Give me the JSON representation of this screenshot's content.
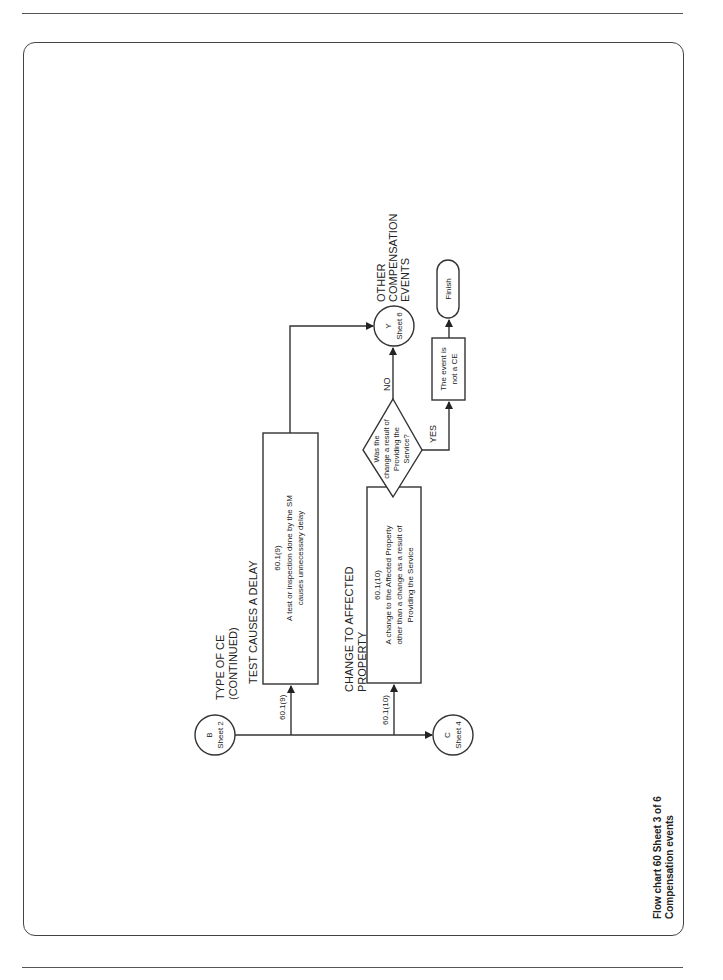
{
  "page": {
    "header_running_title": "FLOW CHARTS",
    "footer_caption": {
      "line1": "Flow chart 60 Sheet 3 of 6",
      "line2": "Compensation events"
    }
  },
  "flowchart": {
    "heading": {
      "line1": "TYPE OF CE",
      "line2": "(CONTINUED)"
    },
    "connectors": {
      "start": {
        "letter": "B",
        "sheet": "Sheet 2"
      },
      "continue": {
        "letter": "C",
        "sheet": "Sheet 4"
      },
      "other": {
        "letter": "Y",
        "sheet": "Sheet 6",
        "label_line1": "OTHER",
        "label_line2": "COMPENSATION",
        "label_line3": "EVENTS"
      }
    },
    "branches": [
      {
        "clause_label": "60.1(9)",
        "title": "TEST CAUSES A DELAY",
        "box_clause": "60.1(9)",
        "box_line1": "A test or inspection done by the SM",
        "box_line2": "causes unnecessary delay"
      },
      {
        "clause_label": "60.1(10)",
        "title_line1": "CHANGE TO AFFECTED",
        "title_line2": "PROPERTY",
        "box_clause": "60.1(10)",
        "box_line1": "A change to the Affected Property",
        "box_line2": "other than a change as a result of",
        "box_line3": "Providing the Service"
      }
    ],
    "decision": {
      "line1": "Was the",
      "line2": "change a result of",
      "line3": "Providing the",
      "line4": "Service?",
      "no_label": "NO",
      "yes_label": "YES"
    },
    "outcome": {
      "line1": "The event is",
      "line2": "not a CE"
    },
    "terminal": {
      "label": "Finish"
    }
  }
}
